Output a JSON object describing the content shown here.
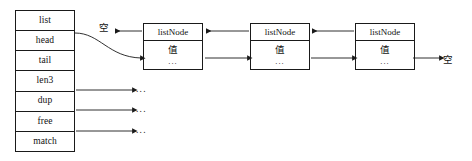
{
  "diagram": {
    "stroke_color": "#1a1a1a",
    "background_color": "#ffffff"
  },
  "struct_table": {
    "name": "list",
    "rows": [
      {
        "label": "list"
      },
      {
        "label": "head"
      },
      {
        "label": "tail"
      },
      {
        "label": "len3"
      },
      {
        "label": "dup"
      },
      {
        "label": "free"
      },
      {
        "label": "match"
      }
    ]
  },
  "nodes": [
    {
      "header": "listNode",
      "value": "值",
      "more": "..."
    },
    {
      "header": "listNode",
      "value": "值",
      "more": "..."
    },
    {
      "header": "listNode",
      "value": "值",
      "more": "..."
    }
  ],
  "null_labels": {
    "left": "空",
    "right": "空"
  },
  "callback_targets": {
    "dup": "...",
    "free": "...",
    "match": "..."
  }
}
